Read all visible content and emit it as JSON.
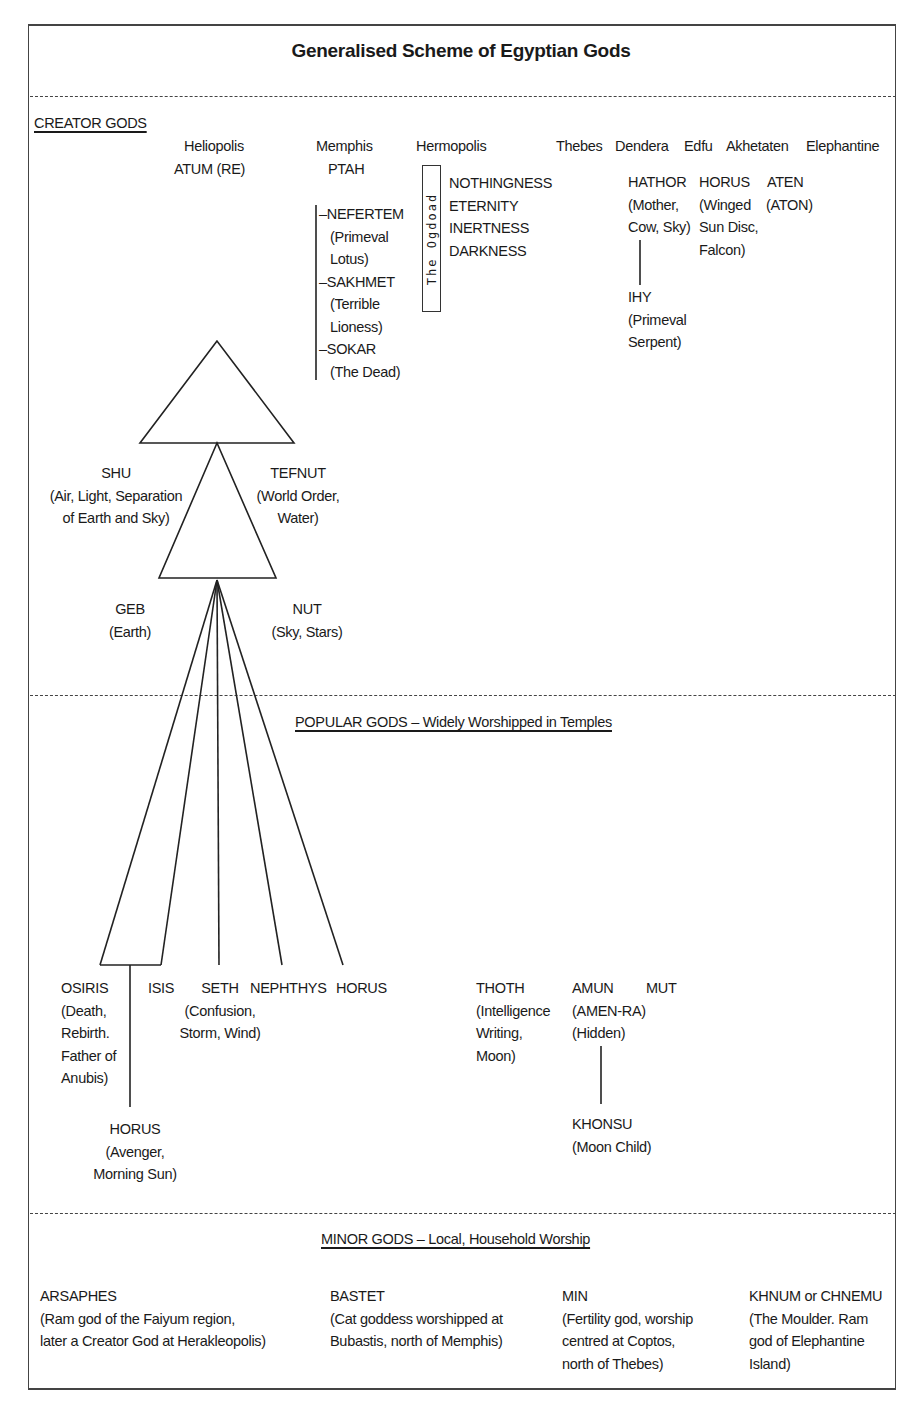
{
  "title": "Generalised Scheme of Egyptian Gods",
  "sections": {
    "creator": {
      "heading": "CREATOR GODS",
      "cities": {
        "heliopolis": "Heliopolis",
        "memphis": "Memphis",
        "hermopolis": "Hermopolis",
        "thebes": "Thebes",
        "dendera": "Dendera",
        "edfu": "Edfu",
        "akhetaten": "Akhetaten",
        "elephantine": "Elephantine"
      },
      "heliopolis_god": "ATUM (RE)",
      "memphis_god": "PTAH",
      "memphis_children": [
        {
          "name": "–NEFERTEM",
          "desc": "(Primeval\nLotus)"
        },
        {
          "name": "–SAKHMET",
          "desc": "(Terrible\nLioness)"
        },
        {
          "name": "–SOKAR",
          "desc": "(The Dead)"
        }
      ],
      "ogdoad_label": "The Ogdoad",
      "ogdoad_members": [
        "NOTHINGNESS",
        "ETERNITY",
        "INERTNESS",
        "DARKNESS"
      ],
      "hathor": {
        "name": "HATHOR",
        "desc": "(Mother,\nCow, Sky)"
      },
      "ihy": {
        "name": "IHY",
        "desc": "(Primeval\nSerpent)"
      },
      "horus_edfu": {
        "name": "HORUS",
        "desc": "(Winged\nSun Disc,\nFalcon)"
      },
      "aten": {
        "name": "ATEN",
        "desc": "(ATON)"
      },
      "shu": {
        "name": "SHU",
        "desc": "(Air, Light, Separation\nof Earth and Sky)"
      },
      "tefnut": {
        "name": "TEFNUT",
        "desc": "(World Order,\nWater)"
      },
      "geb": {
        "name": "GEB",
        "desc": "(Earth)"
      },
      "nut": {
        "name": "NUT",
        "desc": "(Sky, Stars)"
      }
    },
    "popular": {
      "heading": "POPULAR GODS – Widely Worshipped in Temples",
      "osiris": {
        "name": "OSIRIS",
        "desc": "(Death,\nRebirth.\nFather of\nAnubis)"
      },
      "isis": {
        "name": "ISIS"
      },
      "seth": {
        "name": "SETH",
        "desc": "(Confusion,\nStorm, Wind)"
      },
      "nephthys": {
        "name": "NEPHTHYS"
      },
      "horus": {
        "name": "HORUS"
      },
      "horus_avenger": {
        "name": "HORUS",
        "desc": "(Avenger,\nMorning Sun)"
      },
      "thoth": {
        "name": "THOTH",
        "desc": "(Intelligence\nWriting,\nMoon)"
      },
      "amun": {
        "name": "AMUN",
        "desc": "(AMEN-RA)\n(Hidden)"
      },
      "mut": {
        "name": "MUT"
      },
      "khonsu": {
        "name": "KHONSU",
        "desc": "(Moon Child)"
      }
    },
    "minor": {
      "heading": "MINOR GODS – Local, Household Worship",
      "gods": [
        {
          "name": "ARSAPHES",
          "desc": "(Ram god of the Faiyum region,\nlater a Creator God at Herakleopolis)"
        },
        {
          "name": "BASTET",
          "desc": "(Cat goddess worshipped at\nBubastis, north of Memphis)"
        },
        {
          "name": "MIN",
          "desc": "(Fertility god, worship\ncentred at Coptos,\nnorth of Thebes)"
        },
        {
          "name": "KHNUM or CHNEMU",
          "desc": "(The Moulder. Ram\ngod of Elephantine\nIsland)"
        }
      ]
    }
  }
}
